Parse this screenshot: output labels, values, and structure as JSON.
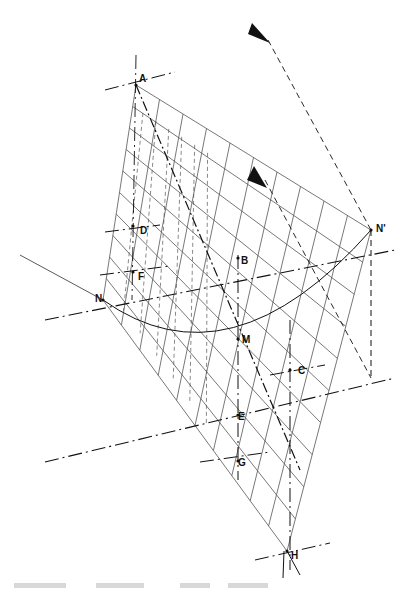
{
  "figure": {
    "labels": {
      "A": "A",
      "B": "B",
      "C": "C",
      "D": "D",
      "E": "E",
      "F": "F",
      "G": "G",
      "H": "H",
      "M": "M",
      "N": "N",
      "N_prime": "N'"
    },
    "arrows": [
      "view-direction-arrow-upper",
      "view-direction-arrow-lower"
    ],
    "colors": {
      "ink": "#111111",
      "grid": "#555555",
      "background": "#ffffff"
    }
  },
  "caption": {
    "legible": false
  }
}
